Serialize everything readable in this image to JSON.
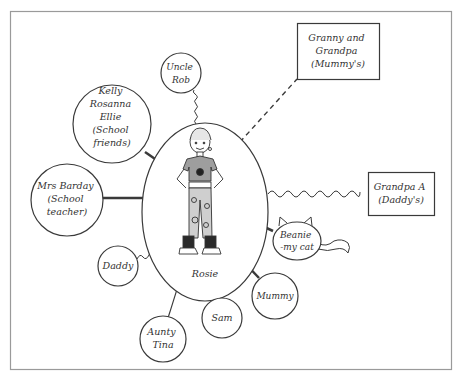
{
  "diagram": {
    "centre": {
      "label": "Rosie"
    },
    "nodes": [
      {
        "id": "uncle-rob",
        "lines": [
          "Uncle",
          "Rob"
        ],
        "shape": "circle",
        "connector": "wavy"
      },
      {
        "id": "school-friends",
        "lines": [
          "Kelly",
          "Rosanna",
          "Ellie",
          "(School",
          "friends)"
        ],
        "shape": "circle",
        "connector": "thick"
      },
      {
        "id": "mrs-barday",
        "lines": [
          "Mrs Barday",
          "(School",
          "teacher)"
        ],
        "shape": "circle",
        "connector": "thick"
      },
      {
        "id": "daddy",
        "lines": [
          "Daddy"
        ],
        "shape": "circle",
        "connector": "wavy"
      },
      {
        "id": "aunty-tina",
        "lines": [
          "Aunty",
          "Tina"
        ],
        "shape": "circle",
        "connector": "thin"
      },
      {
        "id": "sam",
        "lines": [
          "Sam"
        ],
        "shape": "circle",
        "connector": "thin"
      },
      {
        "id": "mummy",
        "lines": [
          "Mummy"
        ],
        "shape": "circle",
        "connector": "thick"
      },
      {
        "id": "beanie",
        "lines": [
          "Beanie",
          "-my cat"
        ],
        "shape": "cat",
        "connector": "thick"
      },
      {
        "id": "grandpa-a",
        "lines": [
          "Grandpa A",
          "(Daddy's)"
        ],
        "shape": "box",
        "connector": "wavy"
      },
      {
        "id": "granny-grandpa",
        "lines": [
          "Granny and",
          "Grandpa",
          "(Mummy's)"
        ],
        "shape": "box",
        "connector": "dashed"
      }
    ],
    "legend_connectors": [
      "thick",
      "thin",
      "wavy",
      "dashed"
    ],
    "colors": {
      "line": "#3a3a3a",
      "frame": "#9a9a9a",
      "background": "#ffffff",
      "shirt": "#9e9e9e",
      "pants": "#cfcfcf",
      "boots": "#2a2a2a"
    }
  }
}
